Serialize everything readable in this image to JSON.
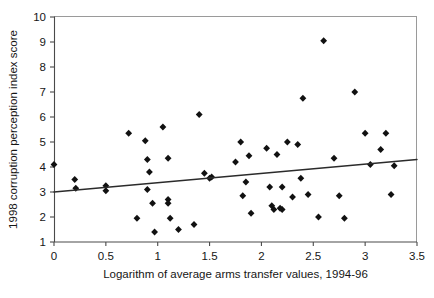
{
  "chart_data": {
    "type": "scatter",
    "title": "",
    "xlabel": "Logarithm of average arms transfer values, 1994-96",
    "ylabel": "1998 corruption perception index score",
    "xlim": [
      0,
      3.5
    ],
    "ylim": [
      1,
      10
    ],
    "xticks": [
      "0",
      "0.5",
      "1",
      "1.5",
      "2",
      "2.5",
      "3",
      "3.5"
    ],
    "xtick_values": [
      0,
      0.5,
      1,
      1.5,
      2,
      2.5,
      3,
      3.5
    ],
    "yticks": [
      "1",
      "2",
      "3",
      "4",
      "5",
      "6",
      "7",
      "8",
      "9",
      "10"
    ],
    "ytick_values": [
      1,
      2,
      3,
      4,
      5,
      6,
      7,
      8,
      9,
      10
    ],
    "grid": false,
    "legend": null,
    "marker_style": "filled-diamond",
    "marker_color": "#111111",
    "series": [
      {
        "name": "countries",
        "points": [
          [
            0.0,
            4.1
          ],
          [
            0.2,
            3.5
          ],
          [
            0.21,
            3.15
          ],
          [
            0.5,
            3.25
          ],
          [
            0.5,
            3.05
          ],
          [
            0.72,
            5.35
          ],
          [
            0.8,
            1.95
          ],
          [
            0.88,
            5.05
          ],
          [
            0.9,
            4.3
          ],
          [
            0.9,
            3.1
          ],
          [
            0.92,
            3.8
          ],
          [
            0.95,
            2.55
          ],
          [
            0.97,
            1.4
          ],
          [
            1.05,
            5.6
          ],
          [
            1.1,
            4.35
          ],
          [
            1.1,
            2.7
          ],
          [
            1.1,
            2.55
          ],
          [
            1.12,
            1.95
          ],
          [
            1.2,
            1.5
          ],
          [
            1.35,
            1.7
          ],
          [
            1.4,
            6.1
          ],
          [
            1.45,
            3.75
          ],
          [
            1.5,
            3.55
          ],
          [
            1.52,
            3.6
          ],
          [
            1.75,
            4.2
          ],
          [
            1.8,
            5.0
          ],
          [
            1.82,
            2.85
          ],
          [
            1.85,
            3.4
          ],
          [
            1.88,
            4.45
          ],
          [
            1.9,
            2.15
          ],
          [
            2.05,
            4.75
          ],
          [
            2.08,
            3.2
          ],
          [
            2.1,
            2.45
          ],
          [
            2.12,
            2.3
          ],
          [
            2.15,
            4.5
          ],
          [
            2.18,
            2.35
          ],
          [
            2.2,
            3.2
          ],
          [
            2.2,
            2.3
          ],
          [
            2.25,
            5.0
          ],
          [
            2.3,
            2.8
          ],
          [
            2.35,
            4.9
          ],
          [
            2.38,
            3.55
          ],
          [
            2.4,
            6.75
          ],
          [
            2.45,
            2.9
          ],
          [
            2.55,
            2.0
          ],
          [
            2.6,
            9.05
          ],
          [
            2.7,
            4.35
          ],
          [
            2.75,
            2.85
          ],
          [
            2.8,
            1.95
          ],
          [
            2.9,
            7.0
          ],
          [
            3.0,
            5.35
          ],
          [
            3.05,
            4.1
          ],
          [
            3.15,
            4.7
          ],
          [
            3.2,
            5.35
          ],
          [
            3.25,
            2.9
          ],
          [
            3.28,
            4.05
          ]
        ]
      }
    ],
    "trendline": {
      "x": [
        0,
        3.5
      ],
      "y": [
        3.0,
        4.3
      ]
    }
  }
}
